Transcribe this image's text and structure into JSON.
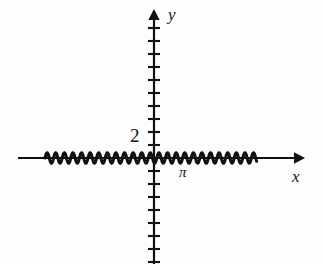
{
  "figure": {
    "kind": "cartesian-plot",
    "background_color": "#fdfdfc",
    "ink_color": "#111111",
    "axes": {
      "x_axis_label": "x",
      "y_axis_label": "y",
      "x_axis_pixel_y": 158,
      "y_axis_pixel_x": 154,
      "x_axis_start_px": 18,
      "x_axis_end_px": 302,
      "y_axis_top_px": 12,
      "y_axis_bottom_px": 264,
      "tick_spacing_px": 13,
      "tick_half_length_px": 6,
      "arrowheads": [
        "x-positive",
        "y-positive"
      ]
    },
    "tick_labels": [
      {
        "name": "y-tick-2",
        "text": "2",
        "axis": "y",
        "pixel_x": 130,
        "pixel_y": 126
      }
    ],
    "annotations": [
      {
        "name": "x-mark-pi",
        "text": "π",
        "axis": "x",
        "pixel_x": 179,
        "pixel_y": 165
      }
    ]
  },
  "chart_data": {
    "type": "line",
    "title": "",
    "subtitle": "",
    "xlabel": "x",
    "ylabel": "y",
    "legend": [],
    "legend_position": "none",
    "grid": false,
    "axis_ticks": {
      "x": {
        "labels": [
          "π"
        ],
        "label_values": [
          3.14159
        ],
        "minor_ticks_only": true
      },
      "y": {
        "labels": [
          "2"
        ],
        "label_values": [
          2
        ],
        "minor_ticks_only": true
      }
    },
    "xlim": [
      -8.5,
      11.0
    ],
    "ylim": [
      -8.0,
      8.0
    ],
    "wave": {
      "drawn_x_start_px": 45,
      "drawn_x_end_px": 257,
      "baseline_px": 158,
      "amplitude_px": 5.2,
      "period_px": 8.6,
      "cycles_visible": 24.6,
      "amplitude_units": 0.4,
      "period_units": 0.66,
      "frequency_units": 9.5
    },
    "series": [
      {
        "name": "oscillation",
        "color": "#111111",
        "line_width_px": 3,
        "x": [
          -8.5,
          -4.25,
          0,
          4.25,
          8.5
        ],
        "values": [
          0,
          0,
          0,
          0,
          0
        ],
        "note": "Envelope is flat at y = 0 with ±0.4 oscillation"
      }
    ]
  }
}
